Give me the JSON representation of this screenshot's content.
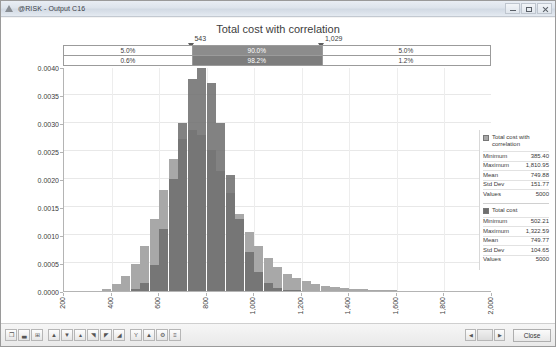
{
  "window": {
    "title": "@RISK - Output C16",
    "app_icon": "risk-triangle-icon",
    "minimize_label": "Minimize",
    "maximize_label": "Maximize",
    "close_label": "Close"
  },
  "chart": {
    "title": "Total cost with correlation"
  },
  "delimiters": {
    "left_value": "543",
    "right_value": "1,029",
    "left_x_pct": 30.0,
    "right_x_pct": 60.5
  },
  "percentile_bars": [
    {
      "name": "probability-row",
      "segments": [
        {
          "label": "5.0%",
          "start_pct": 0,
          "end_pct": 30.0,
          "highlight": false
        },
        {
          "label": "90.0%",
          "start_pct": 30.0,
          "end_pct": 60.5,
          "highlight": true
        },
        {
          "label": "5.0%",
          "start_pct": 60.5,
          "end_pct": 100,
          "highlight": false
        }
      ]
    },
    {
      "name": "secondary-probability-row",
      "segments": [
        {
          "label": "0.6%",
          "start_pct": 0,
          "end_pct": 30.0,
          "highlight": false
        },
        {
          "label": "98.2%",
          "start_pct": 30.0,
          "end_pct": 60.5,
          "highlight": true
        },
        {
          "label": "1.2%",
          "start_pct": 60.5,
          "end_pct": 100,
          "highlight": false
        }
      ]
    }
  ],
  "legend": {
    "entries": [
      {
        "name": "Total cost with correlation",
        "color": "#a8a8a8",
        "stats": [
          {
            "label": "Minimum",
            "value": "385.40"
          },
          {
            "label": "Maximum",
            "value": "1,810.95"
          },
          {
            "label": "Mean",
            "value": "749.88"
          },
          {
            "label": "Std Dev",
            "value": "151.77"
          },
          {
            "label": "Values",
            "value": "5000"
          }
        ]
      },
      {
        "name": "Total cost",
        "color": "#6e6e6e",
        "stats": [
          {
            "label": "Minimum",
            "value": "502.21"
          },
          {
            "label": "Maximum",
            "value": "1,322.59"
          },
          {
            "label": "Mean",
            "value": "749.77"
          },
          {
            "label": "Std Dev",
            "value": "104.65"
          },
          {
            "label": "Values",
            "value": "5000"
          }
        ]
      }
    ]
  },
  "toolbar": {
    "left_buttons": [
      {
        "name": "copy-icon",
        "glyph": "❐"
      },
      {
        "name": "chart-bar-icon",
        "glyph": "▃"
      },
      {
        "name": "grid-icon",
        "glyph": "⊞"
      },
      {
        "name": "histogram-icon",
        "glyph": "▲"
      },
      {
        "name": "cumulative-descending-icon",
        "glyph": "▼"
      },
      {
        "name": "cumulative-ascending-icon",
        "glyph": "▴"
      },
      {
        "name": "area-chart-icon",
        "glyph": "◥"
      },
      {
        "name": "summary-chart-icon",
        "glyph": "◤"
      },
      {
        "name": "scatter-icon",
        "glyph": "◢"
      },
      {
        "name": "filter-icon",
        "glyph": "Y"
      },
      {
        "name": "overlay-icon",
        "glyph": "▲"
      },
      {
        "name": "settings-icon",
        "glyph": "⚙"
      },
      {
        "name": "list-icon",
        "glyph": "≡"
      }
    ],
    "nav": {
      "prev_glyph": "◀",
      "next_glyph": "▶",
      "thumb_label": ""
    },
    "close_label": "Close"
  },
  "chart_data": {
    "type": "bar",
    "title": "Total cost with correlation",
    "xlabel": "",
    "ylabel": "",
    "xlim": [
      200,
      2000
    ],
    "ylim": [
      0.0,
      0.004
    ],
    "grid": true,
    "legend_position": "right",
    "xticks": [
      "200",
      "400",
      "600",
      "800",
      "1,000",
      "1,200",
      "1,400",
      "1,600",
      "1,800",
      "2,000"
    ],
    "yticks": [
      "0.0000",
      "0.0005",
      "0.0010",
      "0.0015",
      "0.0020",
      "0.0025",
      "0.0030",
      "0.0035",
      "0.0040"
    ],
    "bin_width": 40,
    "bin_starts": [
      360,
      400,
      440,
      480,
      520,
      560,
      600,
      640,
      680,
      720,
      760,
      800,
      840,
      880,
      920,
      960,
      1000,
      1040,
      1080,
      1120,
      1160,
      1200,
      1240,
      1280,
      1320,
      1360,
      1400,
      1440,
      1480,
      1520,
      1560,
      1600,
      1640,
      1680,
      1720,
      1760,
      1800
    ],
    "series": [
      {
        "name": "Total cost with correlation",
        "color": "#a8a8a8",
        "values": [
          4e-05,
          0.00012,
          0.00026,
          0.00048,
          0.0008,
          0.00128,
          0.00181,
          0.00235,
          0.00272,
          0.00288,
          0.00279,
          0.00252,
          0.00214,
          0.00175,
          0.00138,
          0.00106,
          0.0008,
          0.00059,
          0.00043,
          0.00031,
          0.00023,
          0.00017,
          0.00012,
          9e-05,
          7e-05,
          5e-05,
          4e-05,
          3e-05,
          2e-05,
          1.5e-05,
          1e-05,
          8e-06,
          6e-06,
          4e-06,
          3e-06,
          2e-06,
          1e-06
        ]
      },
      {
        "name": "Total cost",
        "color": "#6e6e6e",
        "values": [
          0.0,
          0.0,
          0.0,
          3e-05,
          0.00015,
          0.00046,
          0.0011,
          0.002,
          0.003,
          0.00378,
          0.00402,
          0.00372,
          0.003,
          0.00208,
          0.00128,
          0.0007,
          0.00034,
          0.00015,
          6e-05,
          2e-05,
          1e-05,
          4e-06,
          1e-06,
          0.0,
          0.0,
          0.0,
          0.0,
          0.0,
          0.0,
          0.0,
          0.0,
          0.0,
          0.0,
          0.0,
          0.0,
          0.0,
          0.0
        ]
      }
    ]
  }
}
